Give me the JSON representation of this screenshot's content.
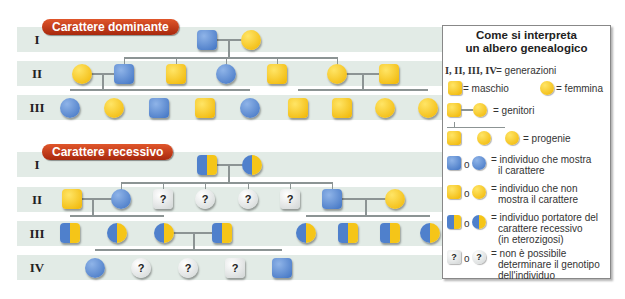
{
  "dominant": {
    "title": "Carattere dominante",
    "generations": [
      "I",
      "II",
      "III"
    ]
  },
  "recessive": {
    "title": "Carattere recessivo",
    "generations": [
      "I",
      "II",
      "III",
      "IV"
    ]
  },
  "legend": {
    "title_line1": "Come si interpreta",
    "title_line2": "un albero genealogico",
    "generations_symbols": "I, II, III, IV",
    "generations_text": "= generazioni",
    "male_text": "= maschio",
    "female_text": "= femmina",
    "parents_text": "= genitori",
    "offspring_text": "= progenie",
    "or": "o",
    "affected_text_1": "= individuo che mostra",
    "affected_text_2": "il carattere",
    "unaffected_text_1": "= individuo che non",
    "unaffected_text_2": "mostra il carattere",
    "carrier_text_1": "= individuo portatore del",
    "carrier_text_2": "carattere recessivo",
    "carrier_text_3": "(in eterozigosi)",
    "unknown_text_1": "= non è possibile",
    "unknown_text_2": "determinare il genotipo",
    "unknown_text_3": "dell'individuo",
    "question_mark": "?"
  },
  "colors": {
    "affected": "#4f80cc",
    "unaffected": "#f5c518",
    "band": "#e2ebe6",
    "pill": "#c23a17"
  },
  "q": "?"
}
